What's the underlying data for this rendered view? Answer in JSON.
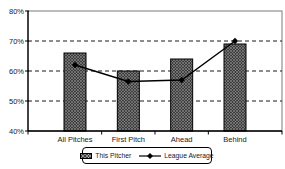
{
  "chart_data": {
    "type": "bar",
    "title": "",
    "categories": [
      "All Pitches",
      "First Pitch",
      "Ahead",
      "Behind"
    ],
    "series": [
      {
        "name": "This Pitcher",
        "type": "bar",
        "values": [
          66,
          60,
          64,
          69
        ]
      },
      {
        "name": "League Average",
        "type": "line",
        "values": [
          62,
          56.5,
          57,
          70
        ]
      }
    ],
    "ylim": [
      40,
      80
    ],
    "ytick_step": 10,
    "ytick_labels": [
      "40%",
      "50%",
      "60%",
      "70%",
      "80%"
    ],
    "xlabel": "",
    "ylabel": "",
    "grid": "horizontal-dashed",
    "legend_position": "bottom"
  },
  "legend": {
    "items": [
      {
        "label": "This Pitcher",
        "marker": "hatched-box"
      },
      {
        "label": "League Average",
        "marker": "line-with-diamond"
      }
    ]
  },
  "colors": {
    "background": "#ffffff",
    "bar_fill": "#3d3d3d",
    "bar_hatch": "#8f8f8f",
    "bar_border": "#000000",
    "axis": "#000000",
    "frame": "#7a7a7a",
    "gridline": "#1a1a1a",
    "line": "#000000",
    "marker": "#000000",
    "text": "#1a1a1a"
  }
}
